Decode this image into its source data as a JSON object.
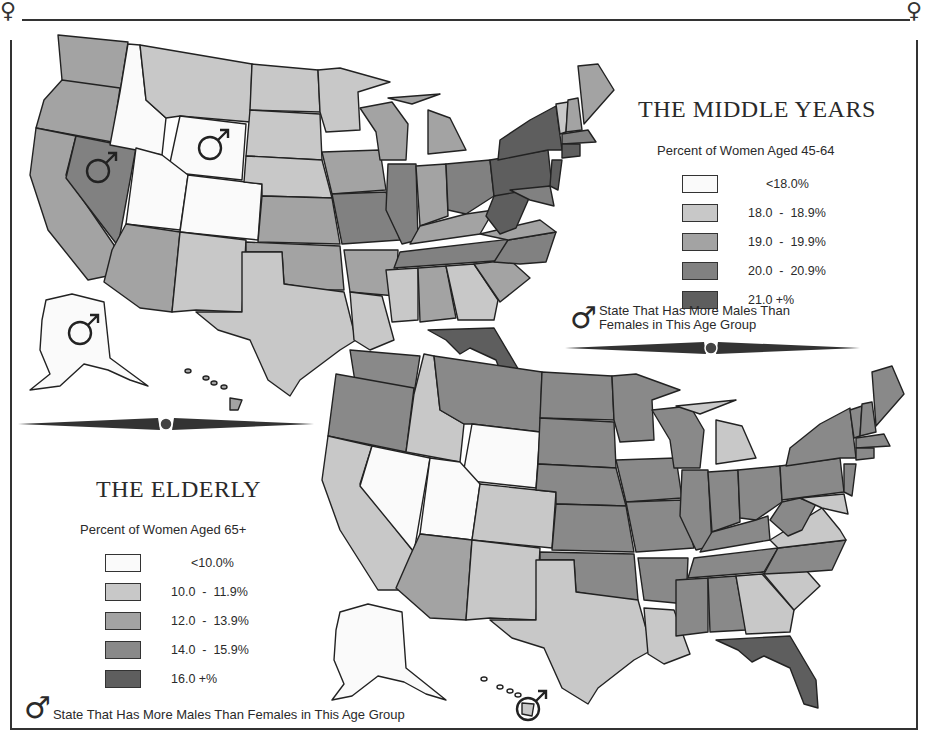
{
  "middle_years": {
    "title": "THE MIDDLE YEARS",
    "subtitle": "Percent of Women Aged 45-64",
    "legend": [
      {
        "label": "<18.0%",
        "color": "#fafafa"
      },
      {
        "label": "18.0  -  18.9%",
        "color": "#c8c8c8"
      },
      {
        "label": "19.0  -  19.9%",
        "color": "#a3a3a3"
      },
      {
        "label": "20.0  -  20.9%",
        "color": "#818181"
      },
      {
        "label": "21.0 +%",
        "color": "#5e5e5e"
      }
    ],
    "male_note_line1": "State That Has More Males Than",
    "male_note_line2": "Females in This Age Group",
    "male_majority_states": [
      "Nevada",
      "Wyoming",
      "Alaska"
    ]
  },
  "elderly": {
    "title": "THE ELDERLY",
    "subtitle": "Percent of Women Aged 65+",
    "legend": [
      {
        "label": "<10.0%",
        "color": "#fafafa"
      },
      {
        "label": "10.0  -  11.9%",
        "color": "#c8c8c8"
      },
      {
        "label": "12.0  -  13.9%",
        "color": "#a3a3a3"
      },
      {
        "label": "14.0  -  15.9%",
        "color": "#898989"
      },
      {
        "label": "16.0 +%",
        "color": "#5e5e5e"
      }
    ],
    "male_note": "State That Has More Males Than Females in This Age Group",
    "male_majority_states": [
      "Hawaii"
    ]
  },
  "symbols": {
    "female": "♀",
    "male": "♂"
  },
  "colors": {
    "c0": "#fafafa",
    "c1": "#c8c8c8",
    "c2": "#a3a3a3",
    "c3": "#818181",
    "c4": "#5e5e5e",
    "outline": "#222222"
  }
}
